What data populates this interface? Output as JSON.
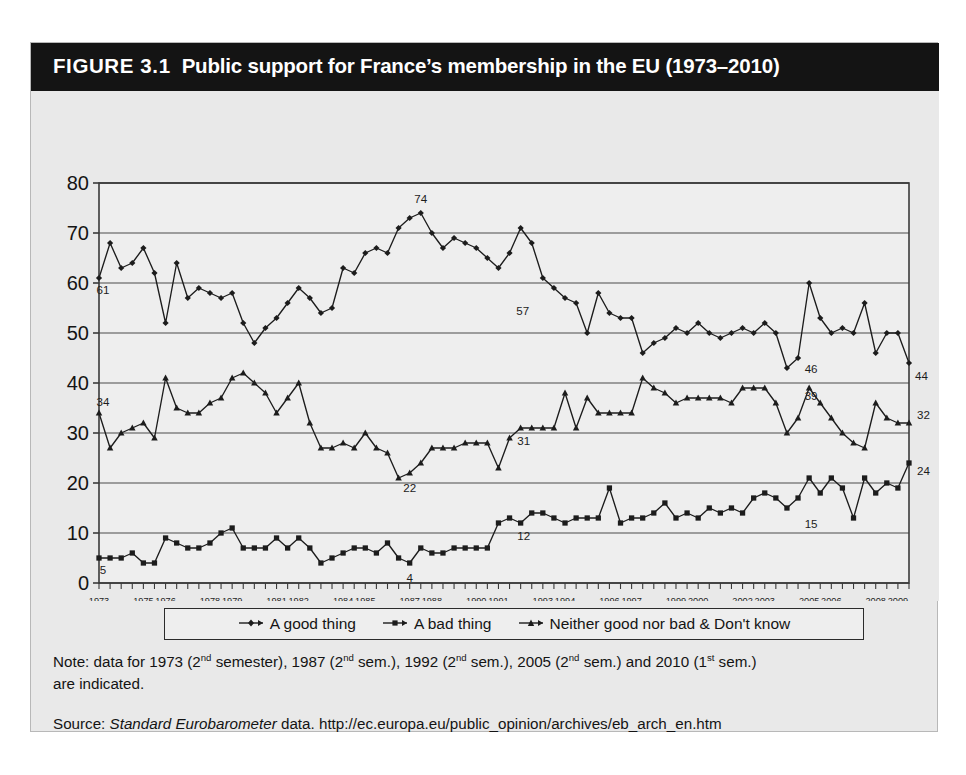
{
  "figure": {
    "number_label": "FIGURE 3.1",
    "title": "Public support for France’s membership in the EU (1973–2010)",
    "note_line1_a": "Note: data for 1973 (2",
    "note_sup1": "nd",
    "note_line1_b": " semester), 1987 (2",
    "note_sup2": "nd",
    "note_line1_c": " sem.), 1992 (2",
    "note_sup3": "nd",
    "note_line1_d": " sem.), 2005 (2",
    "note_sup4": "nd",
    "note_line1_e": " sem.) and 2010 (1",
    "note_sup5": "st",
    "note_line1_f": " sem.)",
    "note_line2": "are indicated.",
    "source_prefix": "Source: ",
    "source_italic": "Standard Eurobarometer",
    "source_rest": " data. http://ec.europa.eu/public_opinion/archives/eb_arch_en.htm"
  },
  "colors": {
    "title_bar": "#141414",
    "title_text": "#ffffff",
    "figure_background": "#e9e9e9",
    "plot_background": "#eeeeee",
    "line": "#1c1c1c",
    "gridline": "#4a4a4a",
    "axis": "#3a3a3a"
  },
  "chart_data": {
    "type": "line",
    "title": "Public support for France’s membership in the EU (1973–2010)",
    "xlabel": "",
    "ylabel": "",
    "ylim": [
      0,
      80
    ],
    "yticks": [
      0,
      10,
      20,
      30,
      40,
      50,
      60,
      70,
      80
    ],
    "grid": true,
    "legend_position": "bottom",
    "x_tick_labels": [
      "1973",
      "1975",
      "1976",
      "1978",
      "1979",
      "1981",
      "1982",
      "1984",
      "1985",
      "1987",
      "1988",
      "1990",
      "1991",
      "1993",
      "1994",
      "1996",
      "1997",
      "1999",
      "2000",
      "2002",
      "2003",
      "2005",
      "2006",
      "2008",
      "2009"
    ],
    "x_tick_indices": [
      0,
      4,
      6,
      10,
      12,
      16,
      18,
      22,
      24,
      28,
      30,
      34,
      36,
      40,
      42,
      46,
      48,
      52,
      54,
      58,
      60,
      64,
      66,
      70,
      72
    ],
    "n_points": 74,
    "x_periods": [
      "1973-2",
      "1974-1",
      "1974-2",
      "1975-1",
      "1975-2",
      "1976-1",
      "1976-2",
      "1977-1",
      "1977-2",
      "1978-1",
      "1978-2",
      "1979-1",
      "1979-2",
      "1980-1",
      "1980-2",
      "1981-1",
      "1981-2",
      "1982-1",
      "1982-2",
      "1983-1",
      "1983-2",
      "1984-1",
      "1984-2",
      "1985-1",
      "1985-2",
      "1986-1",
      "1986-2",
      "1987-1",
      "1987-2",
      "1988-1",
      "1988-2",
      "1989-1",
      "1989-2",
      "1990-1",
      "1990-2",
      "1991-1",
      "1991-2",
      "1992-1",
      "1992-2",
      "1993-1",
      "1993-2",
      "1994-1",
      "1994-2",
      "1995-1",
      "1995-2",
      "1996-1",
      "1996-2",
      "1997-1",
      "1997-2",
      "1998-1",
      "1998-2",
      "1999-1",
      "1999-2",
      "2000-1",
      "2000-2",
      "2001-1",
      "2001-2",
      "2002-1",
      "2002-2",
      "2003-1",
      "2003-2",
      "2004-1",
      "2004-2",
      "2005-1",
      "2005-2",
      "2006-1",
      "2006-2",
      "2007-1",
      "2007-2",
      "2008-1",
      "2008-2",
      "2009-1",
      "2009-2",
      "2010-1"
    ],
    "series": [
      {
        "name": "A good thing",
        "marker": "diamond",
        "values": [
          61,
          68,
          63,
          64,
          67,
          62,
          52,
          64,
          57,
          59,
          58,
          57,
          58,
          52,
          48,
          51,
          53,
          56,
          59,
          57,
          54,
          55,
          63,
          62,
          66,
          67,
          66,
          71,
          73,
          74,
          70,
          67,
          69,
          68,
          67,
          65,
          63,
          66,
          71,
          68,
          61,
          59,
          57,
          56,
          50,
          58,
          54,
          53,
          53,
          46,
          48,
          49,
          51,
          50,
          52,
          50,
          49,
          50,
          51,
          50,
          52,
          50,
          43,
          45,
          60,
          53,
          50,
          51,
          50,
          56,
          46,
          50,
          50,
          44
        ]
      },
      {
        "name": "A bad thing",
        "marker": "square",
        "values": [
          5,
          5,
          5,
          6,
          4,
          4,
          9,
          8,
          7,
          7,
          8,
          10,
          11,
          7,
          7,
          7,
          9,
          7,
          9,
          7,
          4,
          5,
          6,
          7,
          7,
          6,
          8,
          5,
          4,
          7,
          6,
          6,
          7,
          7,
          7,
          7,
          12,
          13,
          12,
          14,
          14,
          13,
          12,
          13,
          13,
          13,
          19,
          12,
          13,
          13,
          14,
          16,
          13,
          14,
          13,
          15,
          14,
          15,
          14,
          17,
          18,
          17,
          15,
          17,
          21,
          18,
          21,
          19,
          13,
          21,
          18,
          20,
          19,
          24
        ]
      },
      {
        "name": "Neither good nor bad & Don't know",
        "marker": "triangle",
        "values": [
          34,
          27,
          30,
          31,
          32,
          29,
          41,
          35,
          34,
          34,
          36,
          37,
          41,
          42,
          40,
          38,
          34,
          37,
          40,
          32,
          27,
          27,
          28,
          27,
          30,
          27,
          26,
          21,
          22,
          24,
          27,
          27,
          27,
          28,
          28,
          28,
          23,
          29,
          31,
          31,
          31,
          31,
          38,
          31,
          37,
          34,
          34,
          34,
          34,
          41,
          39,
          38,
          36,
          37,
          37,
          37,
          37,
          36,
          39,
          39,
          39,
          36,
          30,
          33,
          39,
          36,
          33,
          30,
          28,
          27,
          36,
          33,
          32,
          32
        ]
      }
    ],
    "annotations": [
      {
        "label": "61",
        "period": "1973-2",
        "series": "A good thing",
        "value": 61
      },
      {
        "label": "34",
        "period": "1973-2",
        "series": "Neither good nor bad & Don't know",
        "value": 34
      },
      {
        "label": "5",
        "period": "1973-2",
        "series": "A bad thing",
        "value": 5
      },
      {
        "label": "74",
        "period": "1988-1",
        "series": "A good thing",
        "value": 74
      },
      {
        "label": "22",
        "period": "1987-2",
        "series": "Neither good nor bad & Don't know",
        "value": 22
      },
      {
        "label": "4",
        "period": "1987-2",
        "series": "A bad thing",
        "value": 4
      },
      {
        "label": "57",
        "period": "1992-2",
        "series": "A good thing",
        "value": 57
      },
      {
        "label": "31",
        "period": "1992-2",
        "series": "Neither good nor bad & Don't know",
        "value": 31
      },
      {
        "label": "12",
        "period": "1992-2",
        "series": "A bad thing",
        "value": 12
      },
      {
        "label": "46",
        "period": "2005-2",
        "series": "A good thing",
        "value": 46
      },
      {
        "label": "39",
        "period": "2005-2",
        "series": "Neither good nor bad & Don't know",
        "value": 39
      },
      {
        "label": "15",
        "period": "2005-2",
        "series": "A bad thing",
        "value": 15
      },
      {
        "label": "44",
        "period": "2010-1",
        "series": "A good thing",
        "value": 44
      },
      {
        "label": "32",
        "period": "2010-1",
        "series": "Neither good nor bad & Don't know",
        "value": 32
      },
      {
        "label": "24",
        "period": "2010-1",
        "series": "A bad thing",
        "value": 24
      }
    ]
  }
}
